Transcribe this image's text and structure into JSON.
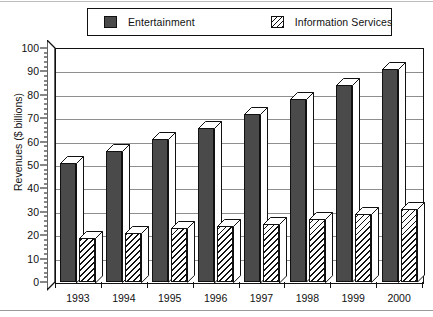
{
  "chart_data": {
    "type": "bar",
    "title": "",
    "subtitle": "",
    "xlabel": "",
    "ylabel": "Revenues ($ billions)",
    "categories": [
      "1993",
      "1994",
      "1995",
      "1996",
      "1997",
      "1998",
      "1999",
      "2000"
    ],
    "series": [
      {
        "name": "Entertainment",
        "values": [
          51,
          56,
          61,
          66,
          72,
          78,
          84,
          91
        ],
        "color": "#4a4a4a",
        "fill": "solid-dark-gray"
      },
      {
        "name": "Information Services",
        "values": [
          19,
          21,
          23,
          24,
          25,
          27,
          29,
          31
        ],
        "color": "#ffffff",
        "fill": "diagonal-hatch"
      }
    ],
    "ylim": [
      0,
      100
    ],
    "ytick_labels": [
      "0",
      "10",
      "20",
      "30",
      "40",
      "50",
      "60",
      "70",
      "80",
      "90",
      "100"
    ],
    "ytick_values": [
      0,
      10,
      20,
      30,
      40,
      50,
      60,
      70,
      80,
      90,
      100
    ],
    "ytick_minor_step": 2,
    "grid": "horizontal",
    "grid_color": "#8e8e8e",
    "legend_position": "top",
    "style": "3d-bars",
    "frame_color": "#111111",
    "background": "#ffffff"
  },
  "legend": {
    "entries": [
      {
        "label": "Entertainment",
        "swatch": "solid-dark-swatch"
      },
      {
        "label": "Information Services",
        "swatch": "hatched-swatch"
      }
    ]
  },
  "axes": {
    "y": {
      "title": "Revenues ($ billions)",
      "ticks": [
        "0",
        "10",
        "20",
        "30",
        "40",
        "50",
        "60",
        "70",
        "80",
        "90",
        "100"
      ]
    },
    "x": {
      "ticks": [
        "1993",
        "1994",
        "1995",
        "1996",
        "1997",
        "1998",
        "1999",
        "2000"
      ]
    }
  }
}
